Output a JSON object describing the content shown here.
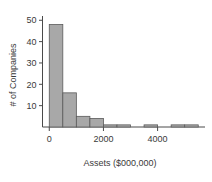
{
  "chart_data": {
    "type": "bar",
    "title": "",
    "subtitle": "",
    "xlabel": "Assets ($000,000)",
    "ylabel": "# of Companies",
    "xlim": [
      -250,
      5750
    ],
    "ylim": [
      0,
      52
    ],
    "grid": false,
    "legend": false,
    "bin_width": 500,
    "xticks": [
      0,
      2000,
      4000
    ],
    "xtick_labels": [
      "0",
      "2000",
      "4000"
    ],
    "yticks": [
      10,
      20,
      30,
      40,
      50
    ],
    "ytick_labels": [
      "10",
      "20",
      "30",
      "40",
      "50"
    ],
    "bar_color": "#a8a8a8",
    "bar_edge_color": "#5a5a5a",
    "axis_color": "#4a4a4a",
    "categories": [
      "0-500",
      "500-1000",
      "1000-1500",
      "1500-2000",
      "2000-2500",
      "2500-3000",
      "3000-3500",
      "3500-4000",
      "4000-4500",
      "4500-5000",
      "5000-5500"
    ],
    "bin_starts": [
      0,
      500,
      1000,
      1500,
      2000,
      2500,
      3000,
      3500,
      4000,
      4500,
      5000
    ],
    "values": [
      48,
      16,
      5,
      4,
      1,
      1,
      0,
      1,
      0,
      1,
      1
    ]
  }
}
